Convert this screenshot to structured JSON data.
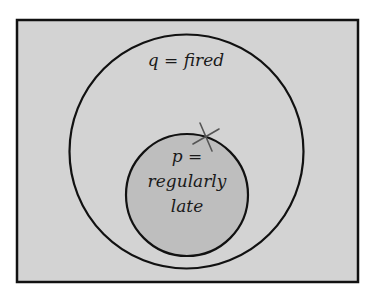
{
  "diagram": {
    "type": "euler-diagram",
    "colors": {
      "page_background": "#ffffff",
      "universe_fill": "#d3d3d3",
      "universe_border": "#111111",
      "outer_circle_fill": "#d3d3d3",
      "inner_circle_fill": "#bdbdbd",
      "stroke": "#111111",
      "x_mark": "#555555"
    },
    "outer_set": {
      "variable": "q",
      "equals": "=",
      "name": "fired",
      "label": "q = fired"
    },
    "inner_set": {
      "variable": "p",
      "equals": "=",
      "line1": "p =",
      "line2": "regularly",
      "line3": "late"
    },
    "marker": {
      "symbol": "x-mark"
    }
  }
}
